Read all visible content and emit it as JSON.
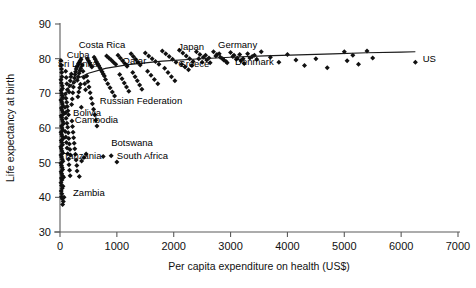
{
  "chart_data": {
    "type": "scatter",
    "title": "",
    "xlabel": "Per capita expenditure on health (US$)",
    "ylabel": "Life expectancy at birth",
    "xlim": [
      0,
      7000
    ],
    "ylim": [
      30,
      90
    ],
    "xticks": [
      0,
      1000,
      2000,
      3000,
      4000,
      5000,
      6000,
      7000
    ],
    "yticks": [
      30,
      40,
      50,
      60,
      70,
      80,
      90
    ],
    "xtick_labels": [
      "0",
      "1000",
      "2000",
      "3000",
      "4000",
      "5000",
      "6000",
      "7000"
    ],
    "ytick_labels": [
      "30",
      "40",
      "50",
      "60",
      "70",
      "80",
      "90"
    ],
    "grid": false,
    "legend": false,
    "marker": "diamond",
    "marker_color": "#111111",
    "trend_line": {
      "present": true,
      "shape": "logarithmic",
      "color": "#1a1a1a",
      "points": [
        [
          60,
          68.0
        ],
        [
          150,
          71.5
        ],
        [
          300,
          74.2
        ],
        [
          500,
          75.8
        ],
        [
          800,
          77.2
        ],
        [
          1200,
          78.3
        ],
        [
          1800,
          79.3
        ],
        [
          2400,
          79.9
        ],
        [
          3000,
          80.4
        ],
        [
          3600,
          80.8
        ],
        [
          4200,
          81.1
        ],
        [
          4800,
          81.4
        ],
        [
          5400,
          81.7
        ],
        [
          6000,
          81.9
        ],
        [
          6250,
          82.0
        ]
      ]
    },
    "annotations": [
      {
        "text": "Costa Rica",
        "x": 330,
        "y": 83.0,
        "anchor": "start"
      },
      {
        "text": "Cuba",
        "x": 120,
        "y": 80.2,
        "anchor": "start"
      },
      {
        "text": "Sri Lanka",
        "x": -40,
        "y": 77.6,
        "anchor": "start"
      },
      {
        "text": "Qatar",
        "x": 1100,
        "y": 78.6,
        "anchor": "start"
      },
      {
        "text": "Japan",
        "x": 2080,
        "y": 82.5,
        "anchor": "start"
      },
      {
        "text": "Germany",
        "x": 2780,
        "y": 83.0,
        "anchor": "start"
      },
      {
        "text": "Greece",
        "x": 2080,
        "y": 77.6,
        "anchor": "start"
      },
      {
        "text": "Denmark",
        "x": 3080,
        "y": 78.2,
        "anchor": "start"
      },
      {
        "text": "US",
        "x": 6380,
        "y": 79.0,
        "anchor": "start"
      },
      {
        "text": "Russian Federation",
        "x": 700,
        "y": 67.0,
        "anchor": "start"
      },
      {
        "text": "Bolivia",
        "x": 230,
        "y": 63.4,
        "anchor": "start"
      },
      {
        "text": "Cambodia",
        "x": 260,
        "y": 61.3,
        "anchor": "start"
      },
      {
        "text": "Botswana",
        "x": 900,
        "y": 54.7,
        "anchor": "start"
      },
      {
        "text": "Tanzania",
        "x": 60,
        "y": 51.2,
        "anchor": "start"
      },
      {
        "text": "South Africa",
        "x": 1000,
        "y": 51.2,
        "anchor": "start"
      },
      {
        "text": "Zambia",
        "x": 230,
        "y": 40.4,
        "anchor": "start"
      }
    ],
    "points": [
      [
        15,
        79.5
      ],
      [
        20,
        78.2
      ],
      [
        26,
        77.0
      ],
      [
        30,
        76.0
      ],
      [
        34,
        74.8
      ],
      [
        18,
        73.9
      ],
      [
        24,
        73.0
      ],
      [
        38,
        72.2
      ],
      [
        44,
        71.4
      ],
      [
        22,
        70.8
      ],
      [
        28,
        70.0
      ],
      [
        36,
        69.4
      ],
      [
        46,
        68.8
      ],
      [
        16,
        68.1
      ],
      [
        32,
        67.5
      ],
      [
        42,
        66.9
      ],
      [
        52,
        66.3
      ],
      [
        24,
        65.8
      ],
      [
        34,
        65.2
      ],
      [
        48,
        64.6
      ],
      [
        58,
        64.0
      ],
      [
        20,
        63.5
      ],
      [
        30,
        63.0
      ],
      [
        40,
        62.4
      ],
      [
        50,
        61.8
      ],
      [
        60,
        61.2
      ],
      [
        26,
        60.6
      ],
      [
        36,
        60.0
      ],
      [
        46,
        59.4
      ],
      [
        18,
        58.8
      ],
      [
        28,
        58.2
      ],
      [
        38,
        57.6
      ],
      [
        56,
        57.0
      ],
      [
        22,
        56.4
      ],
      [
        32,
        55.8
      ],
      [
        44,
        55.2
      ],
      [
        14,
        54.6
      ],
      [
        24,
        54.0
      ],
      [
        34,
        53.4
      ],
      [
        48,
        52.8
      ],
      [
        18,
        52.2
      ],
      [
        28,
        51.6
      ],
      [
        38,
        51.0
      ],
      [
        52,
        50.4
      ],
      [
        16,
        49.8
      ],
      [
        26,
        49.2
      ],
      [
        36,
        48.6
      ],
      [
        46,
        48.0
      ],
      [
        20,
        47.4
      ],
      [
        30,
        46.8
      ],
      [
        42,
        46.2
      ],
      [
        24,
        45.6
      ],
      [
        34,
        45.0
      ],
      [
        18,
        44.2
      ],
      [
        28,
        43.4
      ],
      [
        38,
        42.6
      ],
      [
        22,
        41.8
      ],
      [
        32,
        41.0
      ],
      [
        26,
        40.2
      ],
      [
        40,
        39.6
      ],
      [
        52,
        43.2
      ],
      [
        64,
        45.8
      ],
      [
        70,
        40.0
      ],
      [
        46,
        37.9
      ],
      [
        58,
        38.8
      ],
      [
        100,
        76.4
      ],
      [
        110,
        74.6
      ],
      [
        120,
        72.8
      ],
      [
        130,
        71.0
      ],
      [
        95,
        69.8
      ],
      [
        105,
        68.6
      ],
      [
        118,
        67.4
      ],
      [
        128,
        66.2
      ],
      [
        140,
        65.0
      ],
      [
        150,
        63.8
      ],
      [
        160,
        70.4
      ],
      [
        170,
        72.2
      ],
      [
        180,
        73.6
      ],
      [
        190,
        74.8
      ],
      [
        200,
        75.6
      ],
      [
        88,
        66.0
      ],
      [
        98,
        64.4
      ],
      [
        108,
        62.8
      ],
      [
        122,
        61.4
      ],
      [
        135,
        60.2
      ],
      [
        145,
        58.6
      ],
      [
        155,
        57.0
      ],
      [
        165,
        55.4
      ],
      [
        175,
        53.8
      ],
      [
        185,
        52.2
      ],
      [
        92,
        59.0
      ],
      [
        102,
        57.4
      ],
      [
        112,
        55.8
      ],
      [
        124,
        54.2
      ],
      [
        136,
        52.6
      ],
      [
        148,
        51.0
      ],
      [
        158,
        49.4
      ],
      [
        168,
        47.8
      ],
      [
        178,
        46.2
      ],
      [
        205,
        66.8
      ],
      [
        215,
        68.4
      ],
      [
        225,
        70.2
      ],
      [
        235,
        71.8
      ],
      [
        245,
        73.2
      ],
      [
        255,
        74.4
      ],
      [
        265,
        75.4
      ],
      [
        275,
        76.2
      ],
      [
        285,
        77.0
      ],
      [
        295,
        77.6
      ],
      [
        210,
        62.0
      ],
      [
        220,
        60.4
      ],
      [
        230,
        58.8
      ],
      [
        240,
        57.2
      ],
      [
        250,
        55.6
      ],
      [
        260,
        54.0
      ],
      [
        272,
        52.4
      ],
      [
        284,
        50.8
      ],
      [
        296,
        49.2
      ],
      [
        310,
        78.0
      ],
      [
        325,
        78.6
      ],
      [
        340,
        79.0
      ],
      [
        355,
        79.4
      ],
      [
        370,
        79.8
      ],
      [
        305,
        73.8
      ],
      [
        320,
        74.8
      ],
      [
        335,
        75.8
      ],
      [
        350,
        76.6
      ],
      [
        365,
        77.2
      ],
      [
        315,
        69.0
      ],
      [
        330,
        70.4
      ],
      [
        345,
        71.6
      ],
      [
        360,
        72.6
      ],
      [
        375,
        66.0
      ],
      [
        390,
        78.2
      ],
      [
        405,
        76.4
      ],
      [
        420,
        74.6
      ],
      [
        435,
        72.8
      ],
      [
        450,
        71.0
      ],
      [
        300,
        47.6
      ],
      [
        340,
        46.0
      ],
      [
        380,
        50.5
      ],
      [
        420,
        51.5
      ],
      [
        460,
        52.5
      ],
      [
        480,
        80.0
      ],
      [
        500,
        79.4
      ],
      [
        520,
        78.8
      ],
      [
        540,
        78.2
      ],
      [
        560,
        77.6
      ],
      [
        470,
        75.0
      ],
      [
        490,
        73.4
      ],
      [
        510,
        71.8
      ],
      [
        530,
        70.2
      ],
      [
        550,
        68.6
      ],
      [
        570,
        67.0
      ],
      [
        590,
        65.4
      ],
      [
        610,
        63.8
      ],
      [
        630,
        62.2
      ],
      [
        650,
        60.6
      ],
      [
        600,
        80.4
      ],
      [
        620,
        79.8
      ],
      [
        640,
        79.2
      ],
      [
        660,
        78.6
      ],
      [
        680,
        78.0
      ],
      [
        700,
        77.4
      ],
      [
        720,
        76.8
      ],
      [
        740,
        76.2
      ],
      [
        760,
        75.6
      ],
      [
        780,
        75.0
      ],
      [
        820,
        80.8
      ],
      [
        860,
        80.2
      ],
      [
        900,
        79.6
      ],
      [
        940,
        79.0
      ],
      [
        980,
        78.4
      ],
      [
        800,
        74.0
      ],
      [
        840,
        72.8
      ],
      [
        880,
        71.6
      ],
      [
        920,
        70.4
      ],
      [
        960,
        69.2
      ],
      [
        760,
        51.8
      ],
      [
        900,
        52.0
      ],
      [
        1000,
        50.2
      ],
      [
        1020,
        81.0
      ],
      [
        1060,
        80.2
      ],
      [
        1100,
        79.4
      ],
      [
        1140,
        78.6
      ],
      [
        1180,
        77.8
      ],
      [
        1050,
        75.4
      ],
      [
        1090,
        74.2
      ],
      [
        1130,
        73.0
      ],
      [
        1170,
        71.8
      ],
      [
        1210,
        70.6
      ],
      [
        1250,
        81.4
      ],
      [
        1290,
        80.6
      ],
      [
        1330,
        79.8
      ],
      [
        1370,
        79.0
      ],
      [
        1410,
        78.2
      ],
      [
        1280,
        76.0
      ],
      [
        1320,
        74.8
      ],
      [
        1360,
        73.6
      ],
      [
        1400,
        72.4
      ],
      [
        1440,
        71.2
      ],
      [
        1500,
        81.6
      ],
      [
        1560,
        80.8
      ],
      [
        1620,
        80.0
      ],
      [
        1680,
        79.2
      ],
      [
        1740,
        78.4
      ],
      [
        1540,
        76.4
      ],
      [
        1600,
        75.2
      ],
      [
        1660,
        74.0
      ],
      [
        1720,
        72.8
      ],
      [
        1800,
        82.2
      ],
      [
        1860,
        81.4
      ],
      [
        1920,
        80.6
      ],
      [
        1980,
        79.8
      ],
      [
        2040,
        79.0
      ],
      [
        1840,
        77.2
      ],
      [
        1900,
        76.0
      ],
      [
        1960,
        74.8
      ],
      [
        2020,
        73.6
      ],
      [
        2100,
        82.4
      ],
      [
        2160,
        81.6
      ],
      [
        2220,
        80.8
      ],
      [
        2280,
        80.0
      ],
      [
        2340,
        79.2
      ],
      [
        2140,
        78.4
      ],
      [
        2200,
        77.6
      ],
      [
        2260,
        76.8
      ],
      [
        2320,
        78.0
      ],
      [
        2400,
        82.0
      ],
      [
        2460,
        81.2
      ],
      [
        2520,
        80.4
      ],
      [
        2580,
        79.6
      ],
      [
        2640,
        78.8
      ],
      [
        2440,
        80.0
      ],
      [
        2500,
        79.0
      ],
      [
        2560,
        81.0
      ],
      [
        2620,
        80.2
      ],
      [
        2700,
        82.0
      ],
      [
        2760,
        81.2
      ],
      [
        2820,
        80.4
      ],
      [
        2880,
        79.6
      ],
      [
        2940,
        78.8
      ],
      [
        2740,
        80.8
      ],
      [
        2800,
        81.4
      ],
      [
        2860,
        80.0
      ],
      [
        2920,
        79.2
      ],
      [
        3000,
        81.8
      ],
      [
        3060,
        81.0
      ],
      [
        3120,
        80.2
      ],
      [
        3180,
        79.4
      ],
      [
        3240,
        78.6
      ],
      [
        3040,
        80.6
      ],
      [
        3100,
        79.8
      ],
      [
        3160,
        81.2
      ],
      [
        3220,
        80.0
      ],
      [
        3300,
        81.4
      ],
      [
        3380,
        80.6
      ],
      [
        3460,
        79.8
      ],
      [
        3540,
        82.0
      ],
      [
        3340,
        80.2
      ],
      [
        3420,
        81.0
      ],
      [
        3700,
        80.4
      ],
      [
        3850,
        79.0
      ],
      [
        4000,
        81.2
      ],
      [
        4150,
        79.6
      ],
      [
        4300,
        78.0
      ],
      [
        4500,
        80.0
      ],
      [
        4700,
        77.4
      ],
      [
        5000,
        82.0
      ],
      [
        5050,
        79.4
      ],
      [
        5150,
        81.0
      ],
      [
        5250,
        78.4
      ],
      [
        5400,
        82.2
      ],
      [
        5500,
        80.2
      ],
      [
        6250,
        79.0
      ]
    ]
  }
}
